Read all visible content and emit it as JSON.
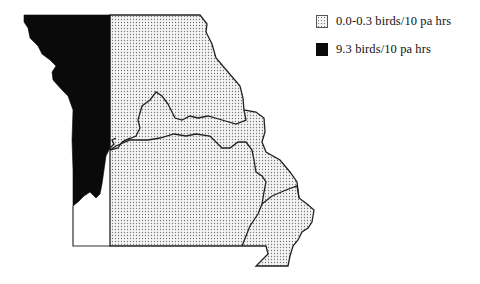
{
  "map": {
    "region": "state-outline",
    "colors": {
      "low_fill": "#f2f2f2",
      "high_fill": "#0a0a0a",
      "boundary": "#222222"
    },
    "zones": [
      {
        "name": "western-strip",
        "category": "high"
      },
      {
        "name": "northeast",
        "category": "low"
      },
      {
        "name": "north-central",
        "category": "low"
      },
      {
        "name": "central-band",
        "category": "low"
      },
      {
        "name": "east-river",
        "category": "low"
      },
      {
        "name": "south",
        "category": "low"
      },
      {
        "name": "southeast",
        "category": "low"
      }
    ]
  },
  "legend": {
    "items": [
      {
        "label": "0.0-0.3 birds/10 pa hrs",
        "style": "dotted"
      },
      {
        "label": "9.3 birds/10 pa hrs",
        "style": "solid"
      }
    ]
  }
}
